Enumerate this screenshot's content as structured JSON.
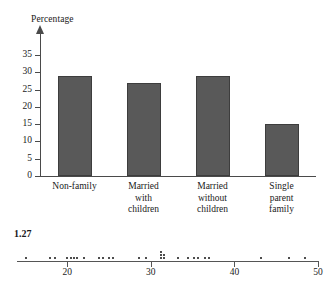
{
  "chart_data": [
    {
      "type": "bar",
      "title": "",
      "ylabel": "Percentage",
      "xlabel": "",
      "categories": [
        "Non-family",
        "Married with children",
        "Married without children",
        "Single parent family"
      ],
      "category_lines": [
        [
          "Non-family"
        ],
        [
          "Married",
          "with",
          "children"
        ],
        [
          "Married",
          "without",
          "children"
        ],
        [
          "Single",
          "parent",
          "family"
        ]
      ],
      "values": [
        29,
        27,
        29,
        15
      ],
      "ylim": [
        0,
        37
      ],
      "yticks": [
        0,
        5,
        10,
        15,
        20,
        25,
        30,
        35
      ],
      "ytick_labels": [
        "0",
        "5",
        "10",
        "15",
        "20",
        "25",
        "30",
        "35"
      ],
      "grid": false,
      "legend": "none",
      "bar_color": "#595959",
      "axis_color": "#4a4a4a"
    },
    {
      "type": "dotplot",
      "title": "1.27",
      "xlabel": "",
      "ylabel": "",
      "xlim": [
        14,
        50
      ],
      "xticks": [
        20,
        30,
        40,
        50
      ],
      "xtick_labels": [
        "20",
        "30",
        "40",
        "50"
      ],
      "grid": false,
      "legend": "none",
      "dot_color": "#4d4d4d",
      "axis_color": "#555555",
      "values": [
        15.1,
        18.0,
        18.6,
        20.0,
        20.4,
        20.8,
        21.2,
        22.0,
        23.8,
        24.3,
        25.0,
        25.5,
        28.6,
        29.4,
        31.2,
        31.2,
        31.2,
        31.5,
        31.5,
        33.3,
        34.4,
        35.2,
        35.6,
        36.5,
        37.0,
        43.2,
        46.5,
        48.4
      ],
      "stacks": [
        {
          "x": 15.1,
          "count": 1
        },
        {
          "x": 18.0,
          "count": 1
        },
        {
          "x": 18.6,
          "count": 1
        },
        {
          "x": 20.0,
          "count": 1
        },
        {
          "x": 20.4,
          "count": 1
        },
        {
          "x": 20.8,
          "count": 1
        },
        {
          "x": 21.2,
          "count": 1
        },
        {
          "x": 22.0,
          "count": 1
        },
        {
          "x": 23.8,
          "count": 1
        },
        {
          "x": 24.3,
          "count": 1
        },
        {
          "x": 25.0,
          "count": 1
        },
        {
          "x": 25.5,
          "count": 1
        },
        {
          "x": 28.6,
          "count": 1
        },
        {
          "x": 29.4,
          "count": 1
        },
        {
          "x": 31.2,
          "count": 3
        },
        {
          "x": 31.6,
          "count": 2
        },
        {
          "x": 33.3,
          "count": 1
        },
        {
          "x": 34.4,
          "count": 1
        },
        {
          "x": 35.2,
          "count": 1
        },
        {
          "x": 35.6,
          "count": 1
        },
        {
          "x": 36.5,
          "count": 1
        },
        {
          "x": 37.0,
          "count": 1
        },
        {
          "x": 43.2,
          "count": 1
        },
        {
          "x": 46.5,
          "count": 1
        },
        {
          "x": 48.4,
          "count": 1
        }
      ]
    }
  ],
  "barchart": {
    "y_axis_title": "Percentage"
  },
  "dotplot": {
    "exercise_number": "1.27"
  }
}
